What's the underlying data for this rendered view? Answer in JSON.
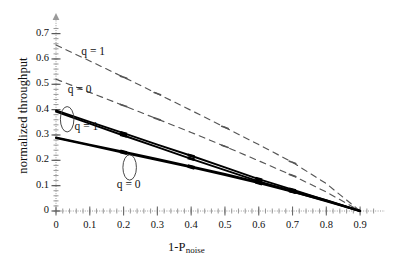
{
  "chart_data": {
    "type": "line",
    "title": "",
    "xlabel": "1-Pnoise",
    "xlabel_main": "1-P",
    "xlabel_sub": "noise",
    "ylabel": "normalized throughput",
    "xlim": [
      0,
      0.95
    ],
    "ylim": [
      0,
      0.73
    ],
    "xticks": [
      "0",
      "0.1",
      "0.2",
      "0.3",
      "0.4",
      "0.5",
      "0.6",
      "0.7",
      "0.8",
      "0.9"
    ],
    "xtick_values": [
      0,
      0.1,
      0.2,
      0.3,
      0.4,
      0.5,
      0.6,
      0.7,
      0.8,
      0.9
    ],
    "yticks": [
      "0",
      "0.1",
      "0.2",
      "0.3",
      "0.4",
      "0.5",
      "0.6",
      "0.7"
    ],
    "ytick_values": [
      0,
      0.1,
      0.2,
      0.3,
      0.4,
      0.5,
      0.6,
      0.7
    ],
    "grid": false,
    "legend": "inline-annotations",
    "minor_ticks": true,
    "series": [
      {
        "name": "q = 1 (dashed)",
        "style": "dashed",
        "color": "#555555",
        "x": [
          0,
          0.1,
          0.2,
          0.3,
          0.4,
          0.5,
          0.6,
          0.7,
          0.8,
          0.9
        ],
        "values": [
          0.655,
          0.592,
          0.528,
          0.463,
          0.397,
          0.33,
          0.262,
          0.192,
          0.108,
          0.0
        ]
      },
      {
        "name": "q = 0 (dashed)",
        "style": "dashed",
        "color": "#555555",
        "x": [
          0,
          0.1,
          0.2,
          0.3,
          0.4,
          0.5,
          0.6,
          0.7,
          0.8,
          0.9
        ],
        "values": [
          0.52,
          0.468,
          0.416,
          0.363,
          0.31,
          0.255,
          0.198,
          0.14,
          0.075,
          0.0
        ]
      },
      {
        "name": "q = 1 (solid, upper of pair)",
        "style": "solid",
        "color": "#000000",
        "x": [
          0,
          0.1,
          0.2,
          0.3,
          0.4,
          0.5,
          0.6,
          0.7,
          0.8,
          0.9
        ],
        "values": [
          0.397,
          0.352,
          0.307,
          0.262,
          0.218,
          0.172,
          0.126,
          0.084,
          0.042,
          0.0
        ]
      },
      {
        "name": "q = 1 (solid, lower of pair)",
        "style": "solid",
        "color": "#000000",
        "x": [
          0,
          0.1,
          0.2,
          0.3,
          0.4,
          0.5,
          0.6,
          0.7,
          0.8,
          0.9
        ],
        "values": [
          0.392,
          0.345,
          0.298,
          0.252,
          0.206,
          0.161,
          0.117,
          0.077,
          0.038,
          0.0
        ]
      },
      {
        "name": "q = 0 (solid, upper of pair)",
        "style": "solid",
        "color": "#000000",
        "x": [
          0,
          0.1,
          0.2,
          0.3,
          0.4,
          0.5,
          0.6,
          0.7,
          0.8,
          0.9
        ],
        "values": [
          0.29,
          0.262,
          0.234,
          0.205,
          0.176,
          0.146,
          0.114,
          0.08,
          0.043,
          0.0
        ]
      },
      {
        "name": "q = 0 (solid, lower of pair)",
        "style": "solid",
        "color": "#000000",
        "x": [
          0,
          0.1,
          0.2,
          0.3,
          0.4,
          0.5,
          0.6,
          0.7,
          0.8,
          0.9
        ],
        "values": [
          0.288,
          0.259,
          0.23,
          0.201,
          0.172,
          0.142,
          0.11,
          0.076,
          0.04,
          0.0
        ]
      }
    ],
    "annotations": [
      {
        "text": "q = 1",
        "for": "dashed-upper",
        "x": 0.075,
        "y": 0.625
      },
      {
        "text": "q = 0",
        "for": "dashed-lower",
        "x": 0.035,
        "y": 0.472
      },
      {
        "text": "q = 1",
        "for": "solid-upper-pair",
        "x": 0.055,
        "y": 0.327
      },
      {
        "text": "q = 0",
        "for": "solid-lower-pair",
        "x": 0.18,
        "y": 0.098
      }
    ],
    "ellipse_callouts": [
      {
        "label": "q = 1",
        "cx": 0.033,
        "cy": 0.362,
        "rx": 0.02,
        "ry": 0.05
      },
      {
        "label": "q = 0",
        "cx": 0.218,
        "cy": 0.172,
        "rx": 0.02,
        "ry": 0.05
      }
    ]
  },
  "labels": {
    "y_axis_title": "normalized throughput",
    "x_axis_title_main": "1-P",
    "x_axis_title_sub": "noise",
    "q1_dashed": "q = 1",
    "q0_dashed": "q = 0",
    "q1_solid": "q = 1",
    "q0_solid": "q = 0"
  }
}
